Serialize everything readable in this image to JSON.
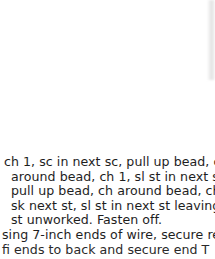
{
  "document": {
    "type": "crochet pattern excerpt",
    "lines": [
      "ch 1, sc in next sc, pull up bead, ch",
      "around bead, ch 1, sl st in next st,",
      "pull up bead, ch around bead, ch 1,",
      "sk next st, sl st in next st leaving last",
      "st unworked. Fasten off.",
      "sing 7-inch ends of wire, secure rem",
      "ﬁ  ends  to  back  and  secure  end  T"
    ]
  }
}
